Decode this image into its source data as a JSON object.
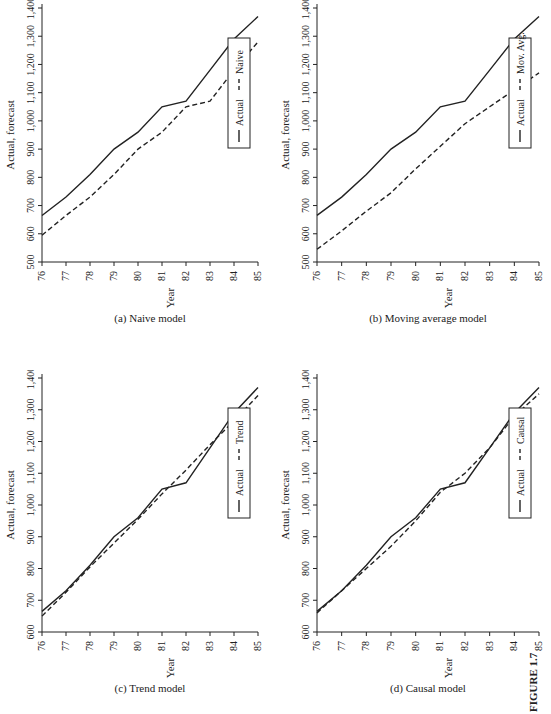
{
  "figure": {
    "label": "FIGURE 1.7",
    "caption": "Forecasting models: actual vs. forecast"
  },
  "chart_data": [
    {
      "id": "a",
      "type": "line",
      "title": "(a) Naive model",
      "xlabel": "Year",
      "ylabel": "Actual, forecast",
      "categories": [
        "76",
        "77",
        "78",
        "79",
        "80",
        "81",
        "82",
        "83",
        "84",
        "85"
      ],
      "yticks": [
        "500",
        "600",
        "700",
        "800",
        "900",
        "1,000",
        "1,100",
        "1,200",
        "1,300",
        "1,400"
      ],
      "ylim": [
        500,
        1400
      ],
      "grid": false,
      "legend": [
        "Actual",
        "Naive"
      ],
      "series": [
        {
          "name": "Actual",
          "style": "solid",
          "values": [
            665,
            730,
            810,
            900,
            960,
            1050,
            1070,
            1180,
            1290,
            1370
          ]
        },
        {
          "name": "Naive",
          "style": "dashed",
          "values": [
            595,
            665,
            730,
            810,
            900,
            960,
            1050,
            1070,
            1180,
            1280
          ]
        }
      ]
    },
    {
      "id": "b",
      "type": "line",
      "title": "(b) Moving average model",
      "xlabel": "Year",
      "ylabel": "Actual, forecast",
      "categories": [
        "76",
        "77",
        "78",
        "79",
        "80",
        "81",
        "82",
        "83",
        "84",
        "85"
      ],
      "yticks": [
        "500",
        "600",
        "700",
        "800",
        "900",
        "1,000",
        "1,100",
        "1,200",
        "1,300",
        "1,400"
      ],
      "ylim": [
        500,
        1400
      ],
      "grid": false,
      "legend": [
        "Actual",
        "Mov. Avg."
      ],
      "series": [
        {
          "name": "Actual",
          "style": "solid",
          "values": [
            665,
            730,
            810,
            900,
            960,
            1050,
            1070,
            1180,
            1290,
            1370
          ]
        },
        {
          "name": "Mov. Avg.",
          "style": "dashed",
          "values": [
            545,
            610,
            680,
            745,
            830,
            910,
            990,
            1050,
            1110,
            1170
          ]
        }
      ]
    },
    {
      "id": "c",
      "type": "line",
      "title": "(c) Trend model",
      "xlabel": "Year",
      "ylabel": "Actual, forecast",
      "categories": [
        "76",
        "77",
        "78",
        "79",
        "80",
        "81",
        "82",
        "83",
        "84",
        "85"
      ],
      "yticks": [
        "600",
        "700",
        "800",
        "900",
        "1,000",
        "1,100",
        "1,200",
        "1,300",
        "1,400"
      ],
      "ylim": [
        600,
        1400
      ],
      "grid": false,
      "legend": [
        "Actual",
        "Trend"
      ],
      "series": [
        {
          "name": "Actual",
          "style": "solid",
          "values": [
            665,
            730,
            810,
            900,
            960,
            1050,
            1070,
            1180,
            1290,
            1370
          ]
        },
        {
          "name": "Trend",
          "style": "dashed",
          "values": [
            650,
            725,
            805,
            880,
            955,
            1035,
            1110,
            1190,
            1265,
            1345
          ]
        }
      ]
    },
    {
      "id": "d",
      "type": "line",
      "title": "(d) Causal model",
      "xlabel": "Year",
      "ylabel": "Actual, forecast",
      "categories": [
        "76",
        "77",
        "78",
        "79",
        "80",
        "81",
        "82",
        "83",
        "84",
        "85"
      ],
      "yticks": [
        "600",
        "700",
        "800",
        "900",
        "1,000",
        "1,100",
        "1,200",
        "1,300",
        "1,400"
      ],
      "ylim": [
        600,
        1400
      ],
      "grid": false,
      "legend": [
        "Actual",
        "Causal"
      ],
      "series": [
        {
          "name": "Actual",
          "style": "solid",
          "values": [
            665,
            730,
            810,
            900,
            960,
            1050,
            1070,
            1180,
            1290,
            1370
          ]
        },
        {
          "name": "Causal",
          "style": "dashed",
          "values": [
            660,
            730,
            800,
            870,
            950,
            1040,
            1100,
            1180,
            1280,
            1350
          ]
        }
      ]
    }
  ]
}
